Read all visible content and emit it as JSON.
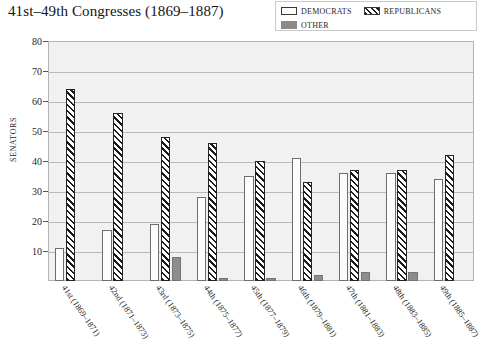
{
  "chart_data": {
    "type": "bar",
    "title": "41st–49th Congresses (1869–1887)",
    "xlabel": "",
    "ylabel": "Senators",
    "ylim": [
      0,
      80
    ],
    "ytick_values": [
      10,
      20,
      30,
      40,
      50,
      60,
      70,
      80
    ],
    "grid": true,
    "legend_position": "top-right",
    "categories": [
      "41st (1869–1871)",
      "42nd (1871–1873)",
      "43rd (1873–1875)",
      "44th (1875–1877)",
      "45th (1877–1879)",
      "46th (1879–1881)",
      "47th (1881–1883)",
      "48th (1883–1885)",
      "49th (1885–1887)"
    ],
    "series": [
      {
        "name": "Democrats",
        "color": "#fcfcfc",
        "values": [
          11,
          17,
          19,
          28,
          35,
          41,
          36,
          36,
          34
        ]
      },
      {
        "name": "Republicans",
        "color": "#1b1b1b",
        "values": [
          64,
          56,
          48,
          46,
          40,
          33,
          37,
          37,
          42
        ]
      },
      {
        "name": "Other",
        "color": "#8d8d8d",
        "values": [
          0,
          0,
          8,
          1,
          1,
          2,
          3,
          3,
          0
        ]
      }
    ]
  },
  "legend": {
    "items": [
      {
        "label": "Democrats",
        "swatch": "dem"
      },
      {
        "label": "Republicans",
        "swatch": "rep"
      },
      {
        "label": "Other",
        "swatch": "oth"
      }
    ]
  }
}
